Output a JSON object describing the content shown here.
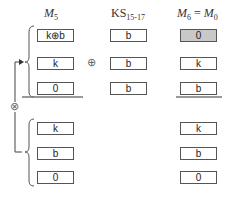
{
  "headers": {
    "col1": {
      "main": "M",
      "sub": "5"
    },
    "col2": {
      "main": "KS",
      "sub": "15-17"
    },
    "col3": {
      "main1": "M",
      "sub1": "6",
      "eq": " = ",
      "main2": "M",
      "sub2": "0"
    }
  },
  "top_group": {
    "col1": [
      "k⊕b",
      "k",
      "0"
    ],
    "col2": [
      "b",
      "b",
      "b"
    ],
    "col3": [
      "0",
      "k",
      "b"
    ]
  },
  "bottom_group": {
    "col1": [
      "k",
      "b",
      "0"
    ],
    "col3": [
      "k",
      "b",
      "0"
    ]
  },
  "operators": {
    "xor": "⊕",
    "otimes": "⊗"
  },
  "colors": {
    "highlight_box": "#c8c8c8",
    "border": "#555555"
  }
}
